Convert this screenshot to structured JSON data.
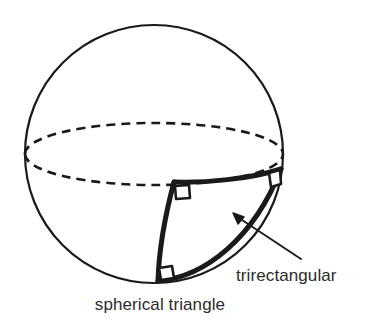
{
  "figure": {
    "background_color": "#ffffff",
    "stroke_color": "#1a1a1a",
    "text_color": "#2b2b2b"
  },
  "labels": {
    "trirectangular": "trirectangular",
    "spherical_triangle": "spherical triangle"
  },
  "geometry": {
    "sphere": {
      "name": "sphere-outline",
      "center_x": 154,
      "center_y": 154,
      "radius": 129,
      "stroke_width": 2.2,
      "style": "solid"
    },
    "equator": {
      "name": "equator-ellipse",
      "center_x": 154,
      "center_y": 154,
      "rx": 129,
      "ry": 31,
      "style": "dashed",
      "dash_pattern": "9 6",
      "stroke_width": 2.4
    },
    "triangle_vertices": [
      {
        "name": "vertex-top-middle",
        "x": 175,
        "y": 182
      },
      {
        "name": "vertex-right",
        "x": 281,
        "y": 170
      },
      {
        "name": "vertex-bottom",
        "x": 158,
        "y": 281
      }
    ],
    "triangle_edges": [
      {
        "name": "edge-equator-arc",
        "from": "vertex-top-middle",
        "to": "vertex-right",
        "style": "solid-thick",
        "stroke_width": 5
      },
      {
        "name": "edge-meridian-arc",
        "from": "vertex-top-middle",
        "to": "vertex-bottom",
        "style": "solid-thick",
        "stroke_width": 5
      },
      {
        "name": "edge-limb-arc",
        "from": "vertex-bottom",
        "to": "vertex-right",
        "style": "solid-thick",
        "stroke_width": 5
      }
    ],
    "right_angle_markers": [
      {
        "name": "right-angle-marker-top",
        "x": 175,
        "y": 182,
        "size": 13
      },
      {
        "name": "right-angle-marker-right",
        "x": 281,
        "y": 170,
        "size": 13
      },
      {
        "name": "right-angle-marker-bottom",
        "x": 158,
        "y": 281,
        "size": 13
      }
    ],
    "annotation_arrow": {
      "name": "trirectangular-arrow",
      "tail_x": 301,
      "tail_y": 259,
      "head_x": 234,
      "head_y": 214,
      "stroke_width": 1.8
    },
    "label_positions": {
      "trirectangular": {
        "x": 236,
        "y": 281,
        "anchor": "start"
      },
      "spherical_triangle": {
        "x": 160,
        "y": 310,
        "anchor": "middle"
      }
    }
  }
}
